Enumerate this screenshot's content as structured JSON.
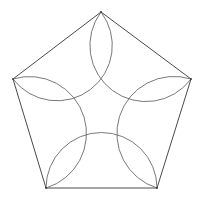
{
  "figure": {
    "title": "",
    "width": 204,
    "height": 199,
    "background": "#ffffff",
    "stroke_color": "#4a4a4a",
    "arc_color": "#6a6a6a",
    "vertices": [
      {
        "name": "top",
        "x": 101,
        "y": 12
      },
      {
        "name": "right",
        "x": 191,
        "y": 79
      },
      {
        "name": "bottom-right",
        "x": 157,
        "y": 188
      },
      {
        "name": "bottom-left",
        "x": 46,
        "y": 188
      },
      {
        "name": "left",
        "x": 13,
        "y": 79
      }
    ],
    "arc_radius": 56,
    "arcs": [
      {
        "from": 0,
        "to": 1
      },
      {
        "from": 1,
        "to": 2
      },
      {
        "from": 2,
        "to": 3
      },
      {
        "from": 3,
        "to": 4
      },
      {
        "from": 4,
        "to": 0
      }
    ]
  }
}
